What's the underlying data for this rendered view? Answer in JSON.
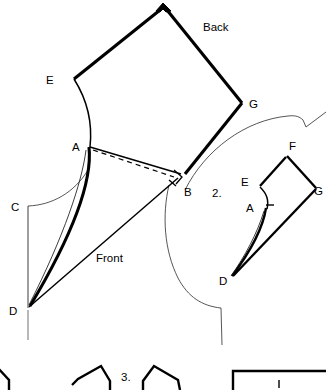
{
  "figure": {
    "title_piece_back": "Back",
    "title_piece_front": "Front",
    "step_two": "2.",
    "step_three": "3."
  },
  "piece_1": {
    "name": "main-pattern-piece",
    "labels": {
      "A": "A",
      "B": "B",
      "C": "C",
      "D": "D",
      "E": "E",
      "G": "G",
      "back": "Back",
      "front": "Front"
    },
    "vertices": {
      "apex": [
        163,
        8
      ],
      "E": [
        74,
        79
      ],
      "G": [
        242,
        103
      ],
      "A": [
        88,
        147
      ],
      "B": [
        176,
        176
      ],
      "C": [
        28,
        206
      ],
      "D": [
        28,
        308
      ]
    },
    "markers": {
      "apex_notch": "filled-triangle-notch",
      "b_square": "right-angle-square",
      "b_tick": "seam-tick",
      "fold_line": "dashed-fold-line"
    }
  },
  "piece_2": {
    "name": "folded-pattern-piece",
    "step": "2.",
    "labels": {
      "A": "A",
      "D": "D",
      "E": "E",
      "F": "F",
      "G": "G"
    },
    "vertices": {
      "F": [
        287,
        155
      ],
      "G": [
        317,
        189
      ],
      "E": [
        262,
        189
      ],
      "A": [
        266,
        207
      ],
      "D": [
        231,
        277
      ]
    },
    "markers": {
      "a_tick": "seam-tick"
    }
  },
  "bottom_row": {
    "name": "cropped-pattern-row",
    "step": "3.",
    "shapes": [
      "partial-piece-left",
      "partial-piece-mid-left",
      "partial-piece-mid-right",
      "rectangle-piece-right"
    ]
  },
  "colors": {
    "ink": "#000000",
    "guide": "#2b2b2b",
    "tail": "#9a9a9a",
    "paper": "#ffffff"
  }
}
